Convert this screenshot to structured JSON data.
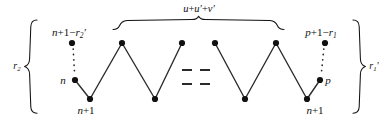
{
  "figure": {
    "kind": "zigzag-lattice-path-diagram",
    "width": 391,
    "height": 121,
    "background_color": "#ffffff",
    "ink_color": "#111111"
  },
  "labels": {
    "top_brace": {
      "text": "u+u′+v′",
      "parts": [
        "u",
        "+",
        "u′",
        "+",
        "v′"
      ],
      "x": 199,
      "y": 9
    },
    "left_brace": {
      "text": "r₂",
      "base": "r",
      "sub": "2",
      "x": 17,
      "y": 67
    },
    "right_brace": {
      "text": "r₁′",
      "base": "r",
      "sub": "1",
      "prime": "′",
      "x": 374,
      "y": 67
    },
    "top_left_vertex": {
      "text": "n+1−r₂′",
      "base": "n",
      "x": 69,
      "y": 33
    },
    "top_right_vertex": {
      "text": "p+1−r₁",
      "base": "p",
      "x": 321,
      "y": 33
    },
    "left_n": {
      "text": "n",
      "x": 63,
      "y": 80
    },
    "left_n_plus_1": {
      "text": "n+1",
      "x": 86,
      "y": 110
    },
    "right_p": {
      "text": "p",
      "x": 328,
      "y": 80
    },
    "right_n_plus_1": {
      "text": "n+1",
      "x": 315,
      "y": 110
    }
  },
  "vertices": [
    {
      "name": "top-left-outer",
      "x": 72,
      "y": 43,
      "label": "n+1−r₂′"
    },
    {
      "name": "left-n",
      "x": 75,
      "y": 80,
      "label": "n"
    },
    {
      "name": "left-n-plus-1",
      "x": 90,
      "y": 99,
      "label": "n+1"
    },
    {
      "name": "peak-1",
      "x": 122,
      "y": 43,
      "label": ""
    },
    {
      "name": "valley-1",
      "x": 155,
      "y": 99,
      "label": ""
    },
    {
      "name": "peak-2",
      "x": 182,
      "y": 43,
      "label": ""
    },
    {
      "name": "peak-3",
      "x": 215,
      "y": 43,
      "label": ""
    },
    {
      "name": "valley-2",
      "x": 245,
      "y": 99,
      "label": ""
    },
    {
      "name": "peak-4",
      "x": 276,
      "y": 43,
      "label": ""
    },
    {
      "name": "right-n-plus-1",
      "x": 307,
      "y": 99,
      "label": "n+1"
    },
    {
      "name": "right-p",
      "x": 320,
      "y": 80,
      "label": "p"
    },
    {
      "name": "top-right-outer",
      "x": 325,
      "y": 43,
      "label": "p+1−r₁"
    }
  ],
  "ellipsis": {
    "description": "two rows of two dashes indicating omitted repeated zigzag sections",
    "rows": 2,
    "dashes_per_row": 2
  }
}
